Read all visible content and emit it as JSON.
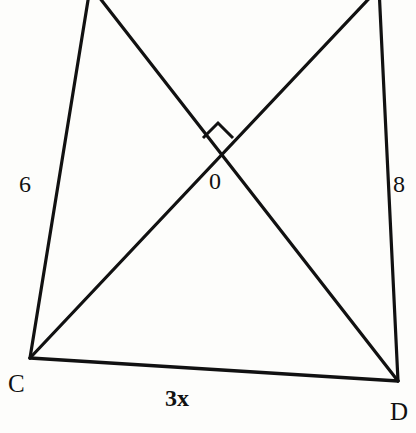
{
  "figure": {
    "name": "quadrilateral-with-intersecting-diagonals",
    "background_color": "#fdfdfb",
    "stroke_color": "#111111",
    "width": 416,
    "height": 433
  },
  "labels": {
    "left_side": "6",
    "right_side": "8",
    "bottom_side": "3x",
    "intersection": "0",
    "vertex_c": "C",
    "vertex_d": "D"
  },
  "geometry": {
    "vertices": {
      "top_left": {
        "x": 90,
        "y": -10
      },
      "top_right": {
        "x": 379,
        "y": -12
      },
      "c": {
        "x": 30,
        "y": 358
      },
      "d": {
        "x": 398,
        "y": 381
      },
      "intersection": {
        "x": 219,
        "y": 153
      }
    },
    "segments": [
      {
        "name": "left-side-top-left-to-c",
        "from": "top_left",
        "to": "c",
        "label": "6"
      },
      {
        "name": "right-side-top-right-to-d",
        "from": "top_right",
        "to": "d",
        "label": "8"
      },
      {
        "name": "bottom-side-c-to-d",
        "from": "c",
        "to": "d",
        "label": "3x"
      },
      {
        "name": "diagonal-top-left-to-d",
        "from": "top_left",
        "to": "d",
        "label": ""
      },
      {
        "name": "diagonal-c-to-top-right",
        "from": "c",
        "to": "top_right",
        "label": ""
      }
    ],
    "right_angle_marker": {
      "name": "right-angle-at-intersection",
      "size": 22,
      "at": {
        "x": 219,
        "y": 153
      }
    }
  }
}
